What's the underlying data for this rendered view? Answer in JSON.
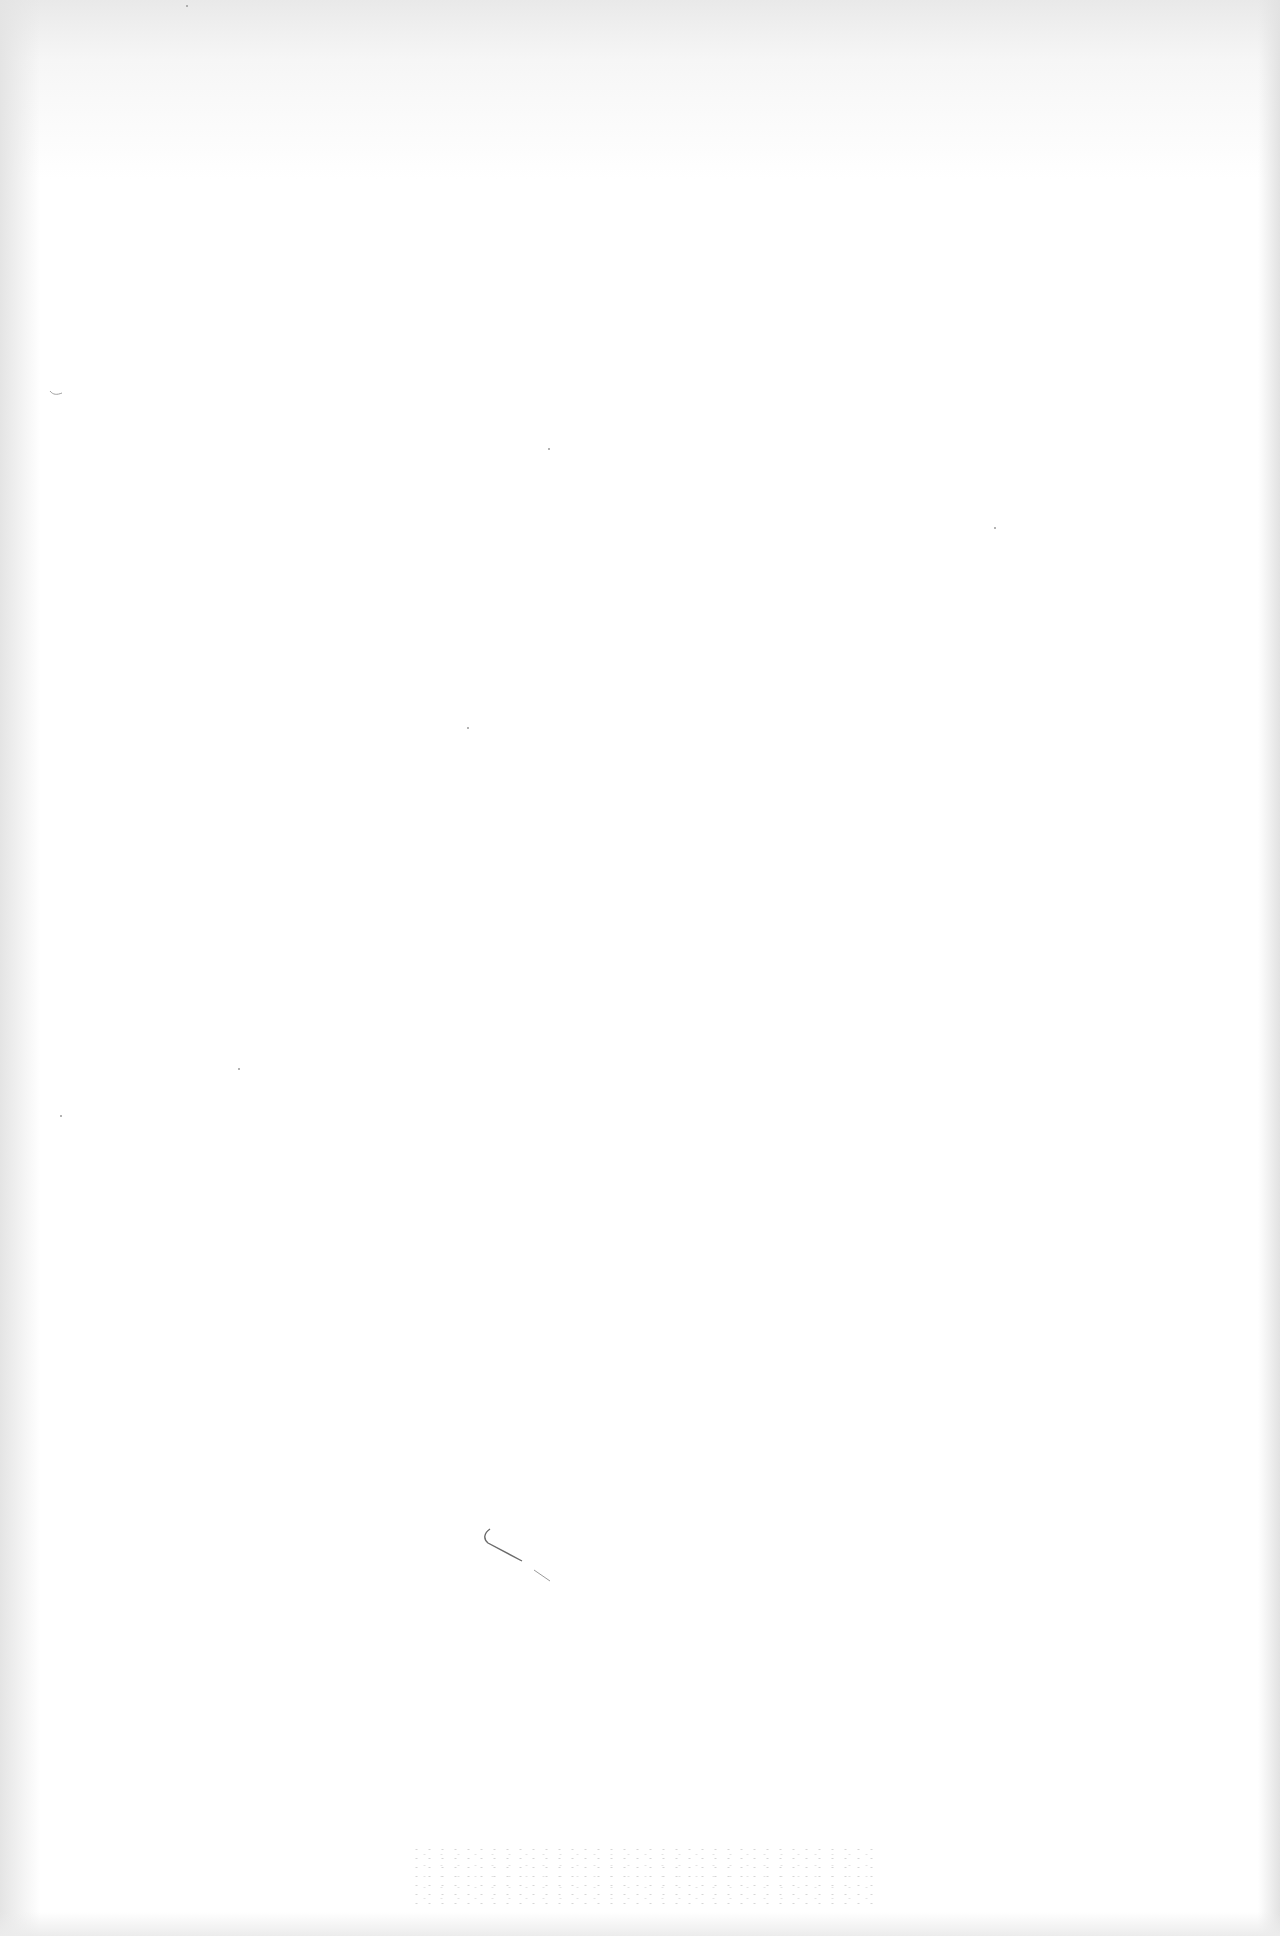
{
  "page": {
    "type": "blank scanned page",
    "background_color": "#ffffff",
    "text_content": []
  },
  "marks": [
    {
      "kind": "pen-stroke",
      "description": "small curved pen mark"
    },
    {
      "kind": "bleed-through-noise",
      "description": "faint speckled show-through near bottom"
    },
    {
      "kind": "speck",
      "description": "small stray marks near left margin"
    }
  ]
}
